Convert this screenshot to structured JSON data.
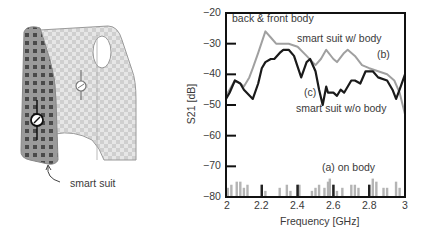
{
  "illustration": {
    "caption": "smart suit"
  },
  "chart_data": {
    "type": "line",
    "title": "",
    "xlabel": "Frequency [GHz]",
    "ylabel": "S21 [dB]",
    "xlim": [
      2,
      3
    ],
    "ylim": [
      -80,
      -20
    ],
    "x_ticks": [
      "2",
      "2.2",
      "2.4",
      "2.6",
      "2.8",
      "3"
    ],
    "y_ticks": [
      "-20",
      "-30",
      "-40",
      "-50",
      "-60",
      "-70",
      "-80"
    ],
    "grid": false,
    "annotations": [
      "back & front body",
      "smart suit w/ body",
      "(b)",
      "(c)",
      "smart suit w/o body",
      "(a) on body"
    ],
    "series": [
      {
        "name": "(b) smart suit w/ body",
        "color": "#a0a0a0",
        "x": [
          2.0,
          2.03,
          2.05,
          2.08,
          2.1,
          2.13,
          2.15,
          2.18,
          2.22,
          2.25,
          2.28,
          2.32,
          2.35,
          2.4,
          2.45,
          2.5,
          2.53,
          2.56,
          2.6,
          2.62,
          2.66,
          2.68,
          2.72,
          2.76,
          2.8,
          2.85,
          2.9,
          2.94,
          2.97,
          3.0
        ],
        "y": [
          -47,
          -44,
          -42,
          -43,
          -44,
          -41,
          -38,
          -33,
          -26,
          -28,
          -30,
          -30,
          -30,
          -31,
          -34,
          -37,
          -35,
          -32,
          -35,
          -36,
          -33,
          -32,
          -34,
          -37,
          -38,
          -39,
          -40,
          -42,
          -46,
          -53
        ]
      },
      {
        "name": "(c) smart suit w/o body",
        "color": "#1a1a1a",
        "x": [
          2.0,
          2.02,
          2.05,
          2.08,
          2.1,
          2.15,
          2.18,
          2.2,
          2.22,
          2.25,
          2.27,
          2.3,
          2.32,
          2.35,
          2.38,
          2.42,
          2.45,
          2.47,
          2.5,
          2.52,
          2.54,
          2.56,
          2.57,
          2.6,
          2.62,
          2.64,
          2.66,
          2.7,
          2.72,
          2.75,
          2.78,
          2.82,
          2.85,
          2.9,
          2.93,
          2.95,
          2.97,
          3.0
        ],
        "y": [
          -48,
          -46,
          -42,
          -43,
          -45,
          -48,
          -43,
          -38,
          -36,
          -35,
          -35,
          -33,
          -32,
          -32,
          -34,
          -41,
          -36,
          -35,
          -39,
          -45,
          -50,
          -44,
          -46,
          -46,
          -47,
          -45,
          -46,
          -42,
          -42,
          -43,
          -39,
          -39,
          -41,
          -42,
          -45,
          -48,
          -45,
          -40
        ]
      },
      {
        "name": "(a) on body",
        "color": "#b4b4b4",
        "type": "bar-noise",
        "x": [
          2.01,
          2.03,
          2.06,
          2.08,
          2.1,
          2.12,
          2.2,
          2.22,
          2.3,
          2.34,
          2.36,
          2.4,
          2.41,
          2.48,
          2.5,
          2.52,
          2.55,
          2.57,
          2.58,
          2.6,
          2.62,
          2.65,
          2.7,
          2.72,
          2.74,
          2.8,
          2.82,
          2.84,
          2.88,
          2.9,
          2.95,
          2.97
        ],
        "y": [
          -77,
          -76,
          -75,
          -75,
          -77,
          -76,
          -76,
          -78,
          -77,
          -76,
          -78,
          -76,
          -76,
          -78,
          -77,
          -76,
          -77,
          -75,
          -74,
          -76,
          -78,
          -77,
          -76,
          -76,
          -77,
          -76,
          -74,
          -75,
          -77,
          -77,
          -75,
          -77
        ]
      }
    ],
    "highlight_bars": {
      "color": "#222222",
      "x": [
        2.2,
        2.4,
        2.6,
        2.8
      ],
      "y": [
        -76,
        -76,
        -76,
        -76
      ]
    }
  }
}
